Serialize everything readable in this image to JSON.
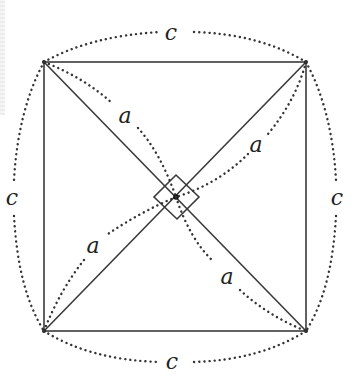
{
  "diagram": {
    "title": "",
    "type": "geometry",
    "colors": {
      "stroke": "#3a3a3a",
      "dotted": "#333333",
      "label": "#222222"
    },
    "vertices": {
      "top_left": [
        44,
        62
      ],
      "top_right": [
        306,
        62
      ],
      "bottom_right": [
        306,
        331
      ],
      "bottom_left": [
        44,
        331
      ],
      "center": [
        176,
        197
      ]
    },
    "labels": {
      "side_top": "c",
      "side_left": "c",
      "side_right": "c",
      "side_bottom": "c",
      "half_diag_top_left": "a",
      "half_diag_top_right": "a",
      "half_diag_bottom_left": "a",
      "half_diag_bottom_right": "a"
    },
    "markers": {
      "right_angle_at_center": true
    }
  }
}
